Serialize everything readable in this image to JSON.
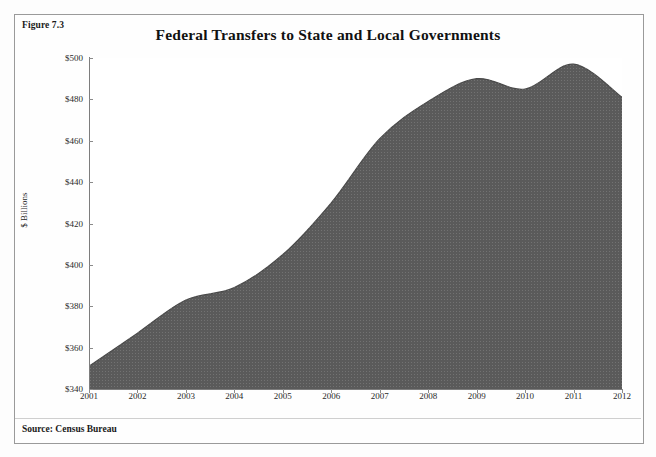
{
  "figure": {
    "label": "Figure 7.3",
    "source_note": "Source: Census Bureau"
  },
  "chart_data": {
    "type": "area",
    "title": "Federal Transfers to State and Local Governments",
    "xlabel": "",
    "ylabel": "$ Billions",
    "categories": [
      "2001",
      "2002",
      "2003",
      "2004",
      "2005",
      "2006",
      "2007",
      "2008",
      "2009",
      "2010",
      "2011",
      "2012"
    ],
    "values": [
      351,
      367,
      383,
      389,
      405,
      430,
      461,
      479,
      490,
      485,
      497,
      481
    ],
    "ylim": [
      340,
      500
    ],
    "ytick_values": [
      340,
      360,
      380,
      400,
      420,
      440,
      460,
      480,
      500
    ],
    "ytick_labels": [
      "$340",
      "$360",
      "$380",
      "$400",
      "$420",
      "$440",
      "$460",
      "$480",
      "$500"
    ],
    "xtick_labels": [
      "2001",
      "2002",
      "2003",
      "2004",
      "2005",
      "2006",
      "2007",
      "2008",
      "2009",
      "2010",
      "2011",
      "2012"
    ],
    "grid": false,
    "legend": "none",
    "series_color": "#5a5a5a",
    "axis_color": "#7d7d7d",
    "smooth": true
  }
}
